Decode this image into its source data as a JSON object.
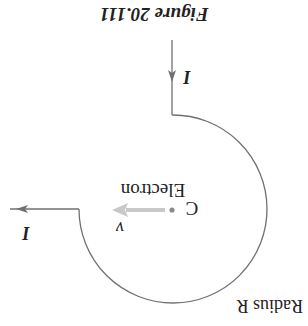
{
  "figure": {
    "caption": "Figure 20.111",
    "orientation": "rotated-180",
    "colors": {
      "wire": "#707070",
      "text": "#222222",
      "velocity_arrow": "#c8c8c8",
      "center_dot": "#8a8a8a",
      "background": "#ffffff"
    },
    "labels": {
      "current_in": "I",
      "current_out": "I",
      "center": "C",
      "particle": "Electron",
      "velocity": "v",
      "radius": "Radius R"
    },
    "icons": {
      "current_in_arrow": "arrow-down-icon",
      "current_out_arrow": "arrow-left-icon",
      "velocity_arrow": "arrow-left-icon"
    }
  }
}
